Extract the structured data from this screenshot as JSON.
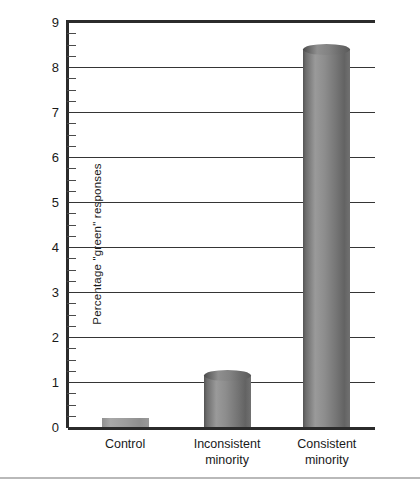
{
  "figure": {
    "title_remnant": "",
    "footer_rule_color": "#b9b9b9",
    "axis_color": "#2b2b2b",
    "grid_color": "#353535",
    "bar_color": "#8d8d8d"
  },
  "chart_data": {
    "type": "bar",
    "title": "",
    "xlabel": "",
    "ylabel": "Percentage \"green\" responses",
    "ylim": [
      0,
      9
    ],
    "yticks": [
      0,
      1,
      2,
      3,
      4,
      5,
      6,
      7,
      8,
      9
    ],
    "ytick_labels": [
      "0",
      "1",
      "2",
      "3",
      "4",
      "5",
      "6",
      "7",
      "8",
      "9"
    ],
    "minor_tick_interval": 0.25,
    "grid": true,
    "legend": "none",
    "categories": [
      "Control",
      "Inconsistent minority",
      "Consistent minority"
    ],
    "category_lines": [
      [
        "Control"
      ],
      [
        "Inconsistent",
        "minority"
      ],
      [
        "Consistent",
        "minority"
      ]
    ],
    "values": [
      0.2,
      1.15,
      8.4
    ],
    "bar_style": "3d-cylinder"
  }
}
